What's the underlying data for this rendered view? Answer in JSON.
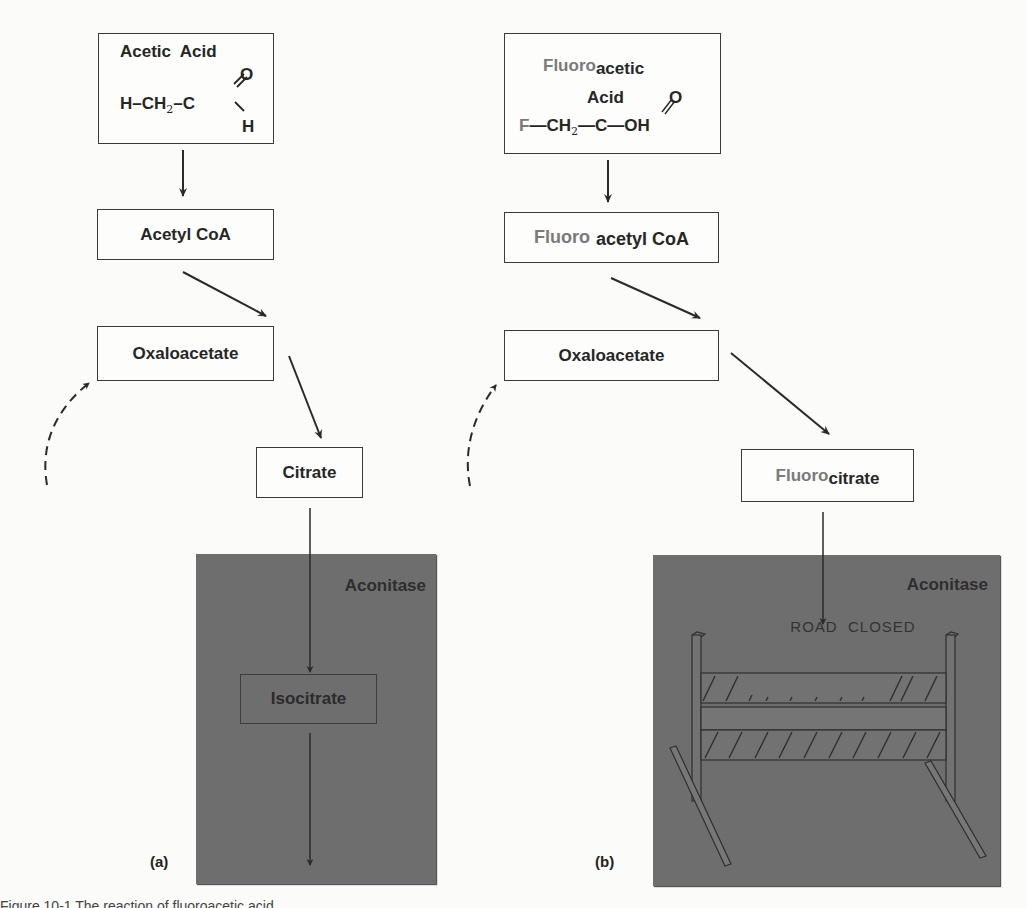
{
  "figure": {
    "caption_partial": "Figure 10-1  The reaction of fluoroacetic acid ...",
    "colors": {
      "background": "#fbfbf9",
      "box_border": "#3a3a3a",
      "text": "#262626",
      "fluoro_text": "#7a7a7a",
      "enzyme_panel": "#6e6e6e"
    }
  },
  "panel_a": {
    "tag": "(a)",
    "start": {
      "title": "Acetic  Acid",
      "formula": {
        "h": "H",
        "ch": "CH",
        "sub": "2",
        "c": "C",
        "o": "O",
        "h2": "H"
      }
    },
    "step2": "Acetyl CoA",
    "step3": "Oxaloacetate",
    "step4": "Citrate",
    "enzyme": {
      "label": "Aconitase",
      "product": "Isocitrate"
    }
  },
  "panel_b": {
    "tag": "(b)",
    "start": {
      "title_prefix": "Fluoro",
      "title_suffix": "acetic",
      "title_line2": "Acid",
      "formula": {
        "f": "F",
        "ch": "CH",
        "sub": "2",
        "c": "C",
        "o": "O",
        "oh": "OH"
      }
    },
    "step2": {
      "prefix": "Fluoro",
      "suffix": "acetyl CoA"
    },
    "step3": "Oxaloacetate",
    "step4": {
      "prefix": "Fluoro",
      "suffix": "citrate"
    },
    "enzyme": {
      "label": "Aconitase",
      "blocker": "ROAD  CLOSED"
    }
  }
}
